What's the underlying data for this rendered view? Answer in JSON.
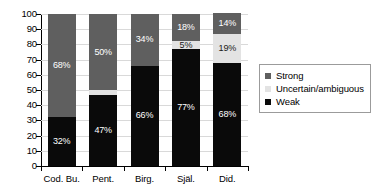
{
  "chart_data": {
    "type": "bar",
    "subtype": "stacked-bar-100",
    "title": "",
    "subtitle": "",
    "xlabel": "",
    "ylabel": "",
    "ylim": [
      0,
      100
    ],
    "yticks": [
      0,
      10,
      20,
      30,
      40,
      50,
      60,
      70,
      80,
      90,
      100
    ],
    "ytick_labels": [
      "0",
      "10",
      "20",
      "30",
      "40",
      "50",
      "60",
      "70",
      "80",
      "90",
      "100"
    ],
    "grid": true,
    "grid_axis": "y",
    "legend_position": "right",
    "categories": [
      "Cod. Bu.",
      "Pent.",
      "Birg.",
      "Själ.",
      "Did."
    ],
    "series": [
      {
        "name": "Weak",
        "color": "#0a0a0a",
        "values": [
          32,
          47,
          66,
          77,
          68
        ],
        "labels": [
          "32%",
          "47%",
          "66%",
          "77%",
          "68%"
        ],
        "label_shown": [
          true,
          true,
          true,
          true,
          true
        ]
      },
      {
        "name": "Uncertain/ambiguous",
        "color": "#e3e3e3",
        "values": [
          0,
          3,
          0,
          5,
          19
        ],
        "labels": [
          "",
          "",
          "",
          "5%",
          "19%"
        ],
        "label_shown": [
          false,
          false,
          false,
          true,
          true
        ]
      },
      {
        "name": "Strong",
        "color": "#5f5f5f",
        "values": [
          68,
          50,
          34,
          18,
          14
        ],
        "labels": [
          "68%",
          "50%",
          "34%",
          "18%",
          "14%"
        ],
        "label_shown": [
          true,
          true,
          true,
          true,
          true
        ]
      }
    ],
    "legend_entries": [
      {
        "label": "Strong",
        "color": "#5f5f5f"
      },
      {
        "label": "Uncertain/ambiguous",
        "color": "#e3e3e3"
      },
      {
        "label": "Weak",
        "color": "#0a0a0a"
      }
    ]
  }
}
